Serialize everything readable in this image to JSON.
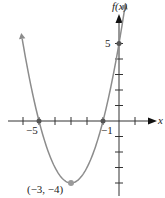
{
  "chart_data": {
    "type": "line",
    "title": "",
    "function": "f(x) = (x + 3)^2 - 4",
    "xlabel": "x",
    "ylabel": "f(x)",
    "xlim": [
      -7,
      1.5
    ],
    "ylim": [
      -4.8,
      7
    ],
    "x_tick_labels": [
      "-5",
      "-1"
    ],
    "y_tick_labels": [
      "5"
    ],
    "grid": false,
    "series": [
      {
        "name": "f(x)",
        "x": [
          -6.2,
          -5,
          -4,
          -3,
          -2,
          -1,
          0,
          0.3
        ],
        "values": [
          6.24,
          0,
          -3,
          -4,
          -3,
          0,
          5,
          6.89
        ],
        "color": "#8c8c8c"
      }
    ],
    "points": [
      {
        "x": -5,
        "y": 0,
        "label": "-5"
      },
      {
        "x": -1,
        "y": 0,
        "label": "-1"
      },
      {
        "x": 0,
        "y": 5,
        "label": "5"
      },
      {
        "x": -3,
        "y": -4,
        "label": "(-3, -4)"
      }
    ],
    "annotations": [
      "(−3, −4)"
    ]
  },
  "labels": {
    "fx": "f(x)",
    "x": "x",
    "five": "5",
    "neg5": "−5",
    "neg1": "−1",
    "vertex": "(−3, −4)"
  }
}
